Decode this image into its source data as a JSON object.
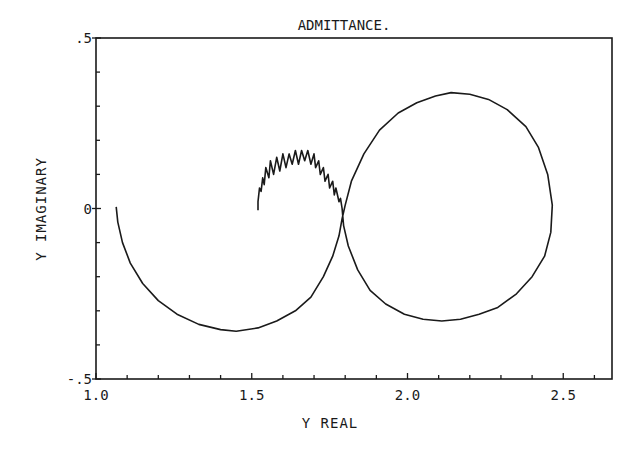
{
  "chart_data": {
    "type": "line",
    "title": "ADMITTANCE.",
    "xlabel": "Y REAL",
    "ylabel": "Y IMAGINARY",
    "xlim": [
      1.0,
      2.65
    ],
    "ylim": [
      -0.5,
      0.5
    ],
    "grid": false,
    "legend": null,
    "x_ticks": [
      {
        "value": 1.0,
        "label": "1.0"
      },
      {
        "value": 1.5,
        "label": "1.5"
      },
      {
        "value": 2.0,
        "label": "2.0"
      },
      {
        "value": 2.5,
        "label": "2.5"
      }
    ],
    "y_ticks": [
      {
        "value": 0.5,
        "label": ".5"
      },
      {
        "value": 0.0,
        "label": "0"
      },
      {
        "value": -0.5,
        "label": "-.5"
      }
    ],
    "x_minor_step": 0.1,
    "y_minor_step": 0.1,
    "series": [
      {
        "name": "admittance-locus",
        "x": [
          1.065,
          1.07,
          1.085,
          1.11,
          1.15,
          1.2,
          1.26,
          1.33,
          1.4,
          1.45,
          1.52,
          1.58,
          1.64,
          1.69,
          1.73,
          1.76,
          1.78,
          1.79,
          1.8,
          1.82,
          1.86,
          1.91,
          1.97,
          2.03,
          2.09,
          2.14,
          2.2,
          2.26,
          2.32,
          2.38,
          2.42,
          2.45,
          2.465,
          2.46,
          2.44,
          2.4,
          2.35,
          2.29,
          2.23,
          2.17,
          2.11,
          2.05,
          1.99,
          1.93,
          1.88,
          1.84,
          1.81,
          1.795,
          1.79,
          1.785,
          1.78,
          1.77,
          1.765,
          1.76,
          1.75,
          1.745,
          1.735,
          1.73,
          1.72,
          1.715,
          1.705,
          1.7,
          1.69,
          1.68,
          1.67,
          1.66,
          1.65,
          1.64,
          1.63,
          1.62,
          1.61,
          1.6,
          1.59,
          1.58,
          1.57,
          1.56,
          1.555,
          1.545,
          1.54,
          1.535,
          1.53,
          1.525,
          1.52,
          1.52
        ],
        "y": [
          0.005,
          -0.04,
          -0.1,
          -0.16,
          -0.22,
          -0.27,
          -0.31,
          -0.34,
          -0.355,
          -0.36,
          -0.35,
          -0.33,
          -0.3,
          -0.26,
          -0.2,
          -0.14,
          -0.08,
          -0.03,
          0.01,
          0.08,
          0.16,
          0.23,
          0.28,
          0.31,
          0.33,
          0.34,
          0.335,
          0.32,
          0.29,
          0.24,
          0.18,
          0.1,
          0.01,
          -0.07,
          -0.14,
          -0.2,
          -0.25,
          -0.29,
          -0.31,
          -0.325,
          -0.33,
          -0.325,
          -0.31,
          -0.28,
          -0.24,
          -0.18,
          -0.11,
          -0.05,
          0.0,
          0.03,
          0.02,
          0.06,
          0.04,
          0.08,
          0.06,
          0.1,
          0.08,
          0.12,
          0.1,
          0.14,
          0.12,
          0.16,
          0.13,
          0.17,
          0.14,
          0.17,
          0.13,
          0.17,
          0.13,
          0.16,
          0.12,
          0.16,
          0.11,
          0.15,
          0.1,
          0.14,
          0.09,
          0.12,
          0.07,
          0.09,
          0.05,
          0.06,
          0.02,
          -0.005
        ]
      }
    ],
    "annotations": []
  },
  "colors": {
    "ink": "#1a1a1a",
    "background": "#ffffff"
  }
}
